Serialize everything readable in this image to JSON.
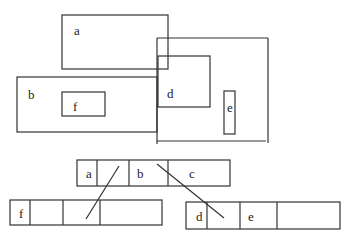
{
  "diagram": {
    "type": "r-tree-spatial-index",
    "stroke_color": "#333333",
    "regions": [
      {
        "label": "a",
        "x": 62,
        "y": 15,
        "w": 106,
        "h": 54,
        "label_x": 74,
        "label_y": 35
      },
      {
        "label": "b",
        "x": 17,
        "y": 77,
        "w": 140,
        "h": 55,
        "label_x": 29,
        "label_y": 98
      },
      {
        "label": "f",
        "x": 62,
        "y": 92,
        "w": 43,
        "h": 24,
        "label_x": 73,
        "label_y": 110
      },
      {
        "label": "d",
        "x": 158,
        "y": 56,
        "w": 52,
        "h": 51,
        "label_x": 167,
        "label_y": 98
      },
      {
        "label": "e",
        "x": 224,
        "y": 91,
        "w": 11,
        "h": 43,
        "label_x": 228,
        "label_y": 112
      },
      {
        "label": "",
        "x": 157,
        "y": 38,
        "w": 111,
        "h": 104
      }
    ],
    "tree": {
      "root": {
        "x": 77,
        "y": 160,
        "w": 153,
        "h": 26,
        "entries": [
          "a",
          "",
          "b",
          "c"
        ],
        "dividers": [
          97,
          129,
          168
        ]
      },
      "left_child": {
        "x": 10,
        "y": 200,
        "w": 152,
        "h": 25,
        "entries": [
          "f",
          "",
          "",
          ""
        ],
        "dividers": [
          30,
          63,
          100
        ]
      },
      "right_child": {
        "x": 186,
        "y": 202,
        "w": 154,
        "h": 27,
        "entries": [
          "d",
          "",
          "e",
          ""
        ],
        "dividers": [
          207,
          240,
          277
        ]
      }
    },
    "pointers": [
      {
        "from": "root.a",
        "to": "left_child",
        "x1": 119,
        "y1": 166,
        "x2": 86,
        "y2": 219
      },
      {
        "from": "root.b",
        "to": "right_child",
        "x1": 157,
        "y1": 164,
        "x2": 224,
        "y2": 218
      }
    ],
    "labels": {
      "a": "a",
      "b": "b",
      "c": "c",
      "d": "d",
      "e": "e",
      "f": "f"
    }
  }
}
